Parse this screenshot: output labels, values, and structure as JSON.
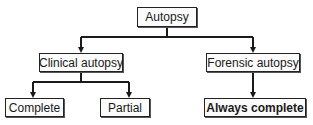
{
  "diagram": {
    "type": "tree",
    "nodes": [
      {
        "id": "autopsy",
        "label": "Autopsy"
      },
      {
        "id": "clinical",
        "label": "Clinical autopsy"
      },
      {
        "id": "forensic",
        "label": "Forensic autopsy"
      },
      {
        "id": "complete",
        "label": "Complete"
      },
      {
        "id": "partial",
        "label": "Partial"
      },
      {
        "id": "always_complete",
        "label": "Always complete",
        "bold": true
      }
    ],
    "edges": [
      [
        "autopsy",
        "clinical"
      ],
      [
        "autopsy",
        "forensic"
      ],
      [
        "clinical",
        "complete"
      ],
      [
        "clinical",
        "partial"
      ],
      [
        "forensic",
        "always_complete"
      ]
    ],
    "colors": {
      "line": "#1a1a1a",
      "box_border": "#222222",
      "box_fill": "#fbfbfb"
    }
  }
}
